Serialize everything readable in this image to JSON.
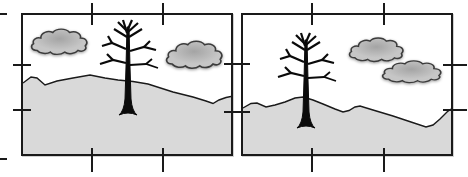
{
  "figure": {
    "colors": {
      "background": "#ffffff",
      "sky": "#ffffff",
      "frame_border": "#1a1a1a",
      "tick": "#1a1a1a",
      "ground_fill": "#d9d9d9",
      "ground_line": "#1a1a1a",
      "cloud_fill": "#c6c6c6",
      "cloud_shade": "#a4a4a4",
      "cloud_outline": "#3c3c3c",
      "tree": "#0a0a0a"
    },
    "panels": [
      {
        "id": "left-panel",
        "tree_position": "center",
        "clouds": [
          "upper-left",
          "middle-right"
        ],
        "horizon": "peak left of tree, sloping down to the right"
      },
      {
        "id": "right-panel",
        "tree_position": "left-of-center",
        "clouds": [
          "upper-right",
          "overlapping lower-right"
        ],
        "horizon": "rounded hill under tree, dipping low toward right edge"
      }
    ],
    "ticks": [
      {
        "o": "v",
        "x": 92,
        "y": 14,
        "len": 22
      },
      {
        "o": "v",
        "x": 163,
        "y": 14,
        "len": 22
      },
      {
        "o": "v",
        "x": 312,
        "y": 14,
        "len": 22
      },
      {
        "o": "v",
        "x": 384,
        "y": 14,
        "len": 22
      },
      {
        "o": "v",
        "x": 92,
        "y": 160,
        "len": 24
      },
      {
        "o": "v",
        "x": 163,
        "y": 160,
        "len": 24
      },
      {
        "o": "v",
        "x": 312,
        "y": 160,
        "len": 24
      },
      {
        "o": "v",
        "x": 384,
        "y": 160,
        "len": 24
      },
      {
        "o": "h",
        "x": 22,
        "y": 65,
        "len": 18
      },
      {
        "o": "h",
        "x": 22,
        "y": 110,
        "len": 18
      },
      {
        "o": "h",
        "x": 237,
        "y": 64,
        "len": 26
      },
      {
        "o": "h",
        "x": 237,
        "y": 112,
        "len": 26
      },
      {
        "o": "h",
        "x": 455,
        "y": 65,
        "len": 24
      },
      {
        "o": "h",
        "x": 455,
        "y": 110,
        "len": 24
      },
      {
        "o": "h",
        "x": 1,
        "y": 14,
        "len": 12
      },
      {
        "o": "h",
        "x": 1,
        "y": 159,
        "len": 12
      }
    ]
  }
}
